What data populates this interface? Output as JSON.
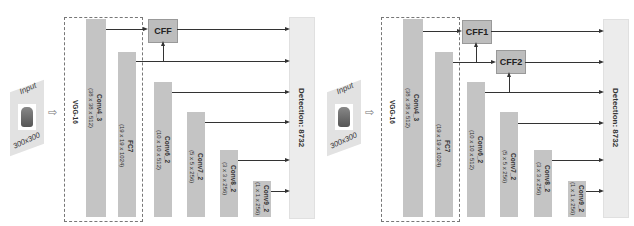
{
  "panels": [
    {
      "input": {
        "title": "Input",
        "size": "300x300"
      },
      "backbone": "VGG-16",
      "layers": [
        {
          "name": "Conv4_3",
          "dims": "(38 x 38 x 512)"
        },
        {
          "name": "FC7",
          "dims": "(19 x 19 x 1024)"
        },
        {
          "name": "Conv6_2",
          "dims": "(10 x 10 x 512)"
        },
        {
          "name": "Conv7_2",
          "dims": "(5 x 5 x 256)"
        },
        {
          "name": "Conv8_2",
          "dims": "(3 x 3 x 256)"
        },
        {
          "name": "Conv9_2",
          "dims": "(1 x 1 x 256)"
        }
      ],
      "fusion": [
        "CFF"
      ],
      "detection": "Detection: 8732"
    },
    {
      "input": {
        "title": "Input",
        "size": "300x300"
      },
      "backbone": "VGG-16",
      "layers": [
        {
          "name": "Conv4_3",
          "dims": "(38 x 38 x 512)"
        },
        {
          "name": "FC7",
          "dims": "(19 x 19 x 1024)"
        },
        {
          "name": "Conv6_2",
          "dims": "(10 x 10 x 512)"
        },
        {
          "name": "Conv7_2",
          "dims": "(5 x 5 x 256)"
        },
        {
          "name": "Conv8_2",
          "dims": "(3 x 3 x 256)"
        },
        {
          "name": "Conv9_2",
          "dims": "(1 x 1 x 256)"
        }
      ],
      "fusion": [
        "CFF1",
        "CFF2"
      ],
      "detection": "Detection: 8732"
    }
  ]
}
